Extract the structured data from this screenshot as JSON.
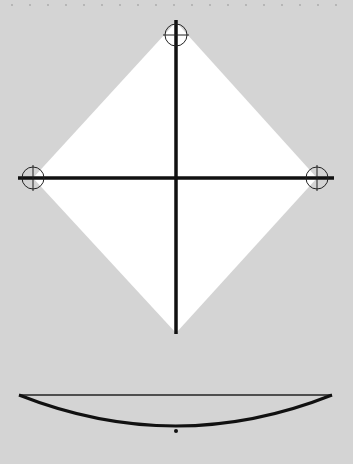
{
  "diagram": {
    "background": "#d4d4d4",
    "shape_fill": "#ffffff",
    "stroke": "#111111",
    "square": {
      "top": [
        176,
        22
      ],
      "right": [
        317,
        178
      ],
      "bottom": [
        176,
        333
      ],
      "left": [
        33,
        178
      ]
    },
    "registration_marks": [
      {
        "name": "top",
        "cx": 176,
        "cy": 35,
        "r": 11
      },
      {
        "name": "left",
        "cx": 33,
        "cy": 178,
        "r": 11
      },
      {
        "name": "right",
        "cx": 317,
        "cy": 178,
        "r": 11
      }
    ],
    "side_view": {
      "chord_y": 395,
      "x1": 19,
      "x2": 332,
      "sag_y": 426,
      "dot": [
        176,
        431
      ]
    }
  }
}
